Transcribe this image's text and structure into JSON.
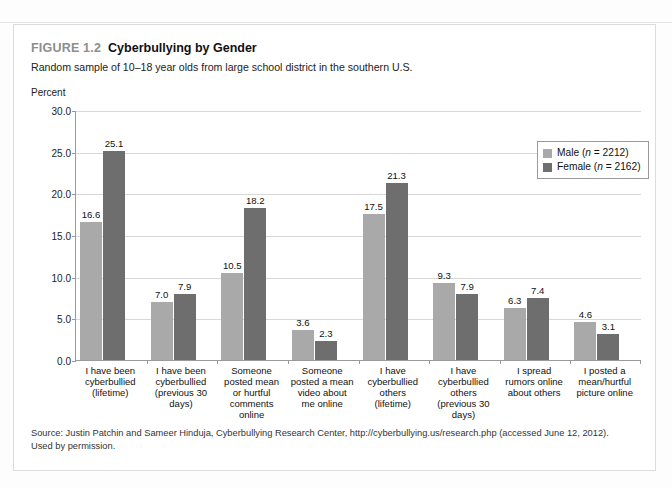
{
  "figure": {
    "number": "FIGURE 1.2",
    "title": "Cyberbullying by Gender",
    "subtitle": "Random sample of 10–18 year olds from large school district in the southern U.S.",
    "axis_name": "Percent",
    "source_line1": "Source: Justin Patchin and Sameer Hinduja, Cyberbullying Research Center, http://cyberbullying.us/research.php (accessed June 12, 2012).",
    "source_line2": "Used by permission."
  },
  "legend": {
    "male": "Male (n = 2212)",
    "female": "Female (n = 2162)",
    "male_prefix": "Male (",
    "female_prefix": "Female (",
    "n_symbol": "n",
    "male_suffix": " = 2212)",
    "female_suffix": " = 2162)"
  },
  "colors": {
    "male": "#a9a9a9",
    "female": "#6e6e6e",
    "grid": "#d8d8d8",
    "axis": "#9a9a9a",
    "figure_number": "#8d8d8d"
  },
  "chart_data": {
    "type": "bar",
    "title": "Cyberbullying by Gender",
    "subtitle": "Random sample of 10–18 year olds from large school district in the southern U.S.",
    "xlabel": "",
    "ylabel": "Percent",
    "ylim": [
      0,
      30
    ],
    "yticks": [
      "0.0",
      "5.0",
      "10.0",
      "15.0",
      "20.0",
      "25.0",
      "30.0"
    ],
    "ytick_values": [
      0,
      5,
      10,
      15,
      20,
      25,
      30
    ],
    "grid": true,
    "legend_position": "top-right",
    "categories": [
      "I have been cyberbullied (lifetime)",
      "I have been cyberbullied (previous 30 days)",
      "Someone posted mean or hurtful comments online",
      "Someone posted a mean video about me online",
      "I have cyberbullied others (lifetime)",
      "I have cyberbullied others (previous 30 days)",
      "I spread rumors online about others",
      "I posted a mean/hurtful picture online"
    ],
    "category_lines": [
      [
        "I have been",
        "cyberbullied",
        "(lifetime)"
      ],
      [
        "I have been",
        "cyberbullied",
        "(previous 30",
        "days)"
      ],
      [
        "Someone",
        "posted mean",
        "or hurtful",
        "comments",
        "online"
      ],
      [
        "Someone",
        "posted a mean",
        "video about",
        "me online"
      ],
      [
        "I have",
        "cyberbullied",
        "others",
        "(lifetime)"
      ],
      [
        "I have",
        "cyberbullied",
        "others",
        "(previous 30",
        "days)"
      ],
      [
        "I spread",
        "rumors online",
        "about others"
      ],
      [
        "I posted a",
        "mean/hurtful",
        "picture online"
      ]
    ],
    "series": [
      {
        "name": "Male (n = 2212)",
        "values": [
          16.6,
          7.0,
          10.5,
          3.6,
          17.5,
          9.3,
          6.3,
          4.6
        ],
        "labels": [
          "16.6",
          "7.0",
          "10.5",
          "3.6",
          "17.5",
          "9.3",
          "6.3",
          "4.6"
        ],
        "color": "#a9a9a9"
      },
      {
        "name": "Female (n = 2162)",
        "values": [
          25.1,
          7.9,
          18.2,
          2.3,
          21.3,
          7.9,
          7.4,
          3.1
        ],
        "labels": [
          "25.1",
          "7.9",
          "18.2",
          "2.3",
          "21.3",
          "7.9",
          "7.4",
          "3.1"
        ],
        "color": "#6e6e6e"
      }
    ]
  }
}
